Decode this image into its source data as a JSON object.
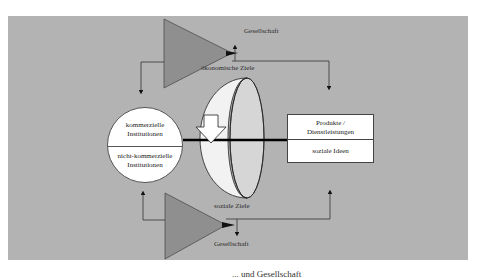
{
  "diagram": {
    "top_label_society": "Gesellschaft",
    "top_label_goal": "ökonomische Ziele",
    "bottom_label_goal": "soziale Ziele",
    "bottom_label_society": "Gesellschaft",
    "left_circle": {
      "top": "kommerzielle\nInstitutionen",
      "bottom": "nicht-kommerzielle\nInstitutionen"
    },
    "right_box": {
      "top": "Produkte /\nDienstleistungen",
      "bottom": "soziale Ideen"
    },
    "caption_partial": "... und Gesellschaft",
    "colors": {
      "panel": "#b3b3b3",
      "triangle": "#8f8f8f",
      "ring_front": "#f2f2f2",
      "ring_back": "#d6d6d6",
      "line": "#000000"
    }
  }
}
